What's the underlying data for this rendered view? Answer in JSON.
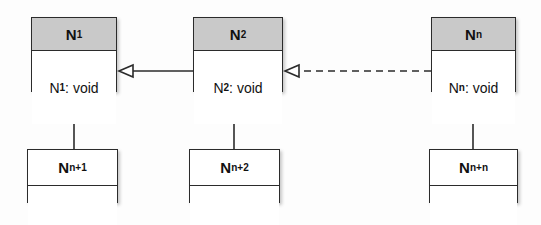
{
  "diagram": {
    "kind": "uml-class-diagram",
    "background_color": "#fdfdfd",
    "line_color": "#2b2b2b",
    "header_fill": "#c9c9c9",
    "body_fill": "#ffffff",
    "top_nodes": [
      {
        "id": "n1",
        "name": "N",
        "name_subscript": "1",
        "operation": "N",
        "operation_subscript": "1",
        "operation_suffix": ": void",
        "x": 31,
        "y": 17,
        "w": 86,
        "h": 75
      },
      {
        "id": "n2",
        "name": "N",
        "name_subscript": "2",
        "operation": "N",
        "operation_subscript": "2",
        "operation_suffix": ": void",
        "x": 193,
        "y": 17,
        "w": 90,
        "h": 75
      },
      {
        "id": "nn",
        "name": "N",
        "name_subscript": "n",
        "operation": "N",
        "operation_subscript": "n",
        "operation_suffix": ": void",
        "x": 431,
        "y": 17,
        "w": 85,
        "h": 75
      }
    ],
    "bottom_nodes": [
      {
        "id": "nn1",
        "name": "N",
        "name_subscript": "n+1",
        "x": 27,
        "y": 149,
        "w": 91,
        "h": 54
      },
      {
        "id": "nn2",
        "name": "N",
        "name_subscript": "n+2",
        "x": 189,
        "y": 149,
        "w": 91,
        "h": 54
      },
      {
        "id": "nnn",
        "name": "N",
        "name_subscript": "n+n",
        "x": 429,
        "y": 149,
        "w": 89,
        "h": 54
      }
    ],
    "connectors": [
      {
        "id": "n2-to-n1",
        "type": "generalization",
        "style": "solid",
        "arrow": "hollow-triangle",
        "from": "n2",
        "to": "n1",
        "orientation": "horizontal"
      },
      {
        "id": "nn-to-n2",
        "type": "realization",
        "style": "dashed",
        "arrow": "hollow-triangle",
        "from": "nn",
        "to": "n2",
        "orientation": "horizontal"
      },
      {
        "id": "nn1-to-n1",
        "type": "generalization",
        "style": "solid",
        "arrow": "hollow-triangle",
        "from": "nn1",
        "to": "n1",
        "orientation": "vertical"
      },
      {
        "id": "nn2-to-n2",
        "type": "generalization",
        "style": "solid",
        "arrow": "hollow-triangle",
        "from": "nn2",
        "to": "n2",
        "orientation": "vertical"
      },
      {
        "id": "nnn-to-nn",
        "type": "generalization",
        "style": "solid",
        "arrow": "hollow-triangle",
        "from": "nnn",
        "to": "nn",
        "orientation": "vertical"
      }
    ]
  }
}
